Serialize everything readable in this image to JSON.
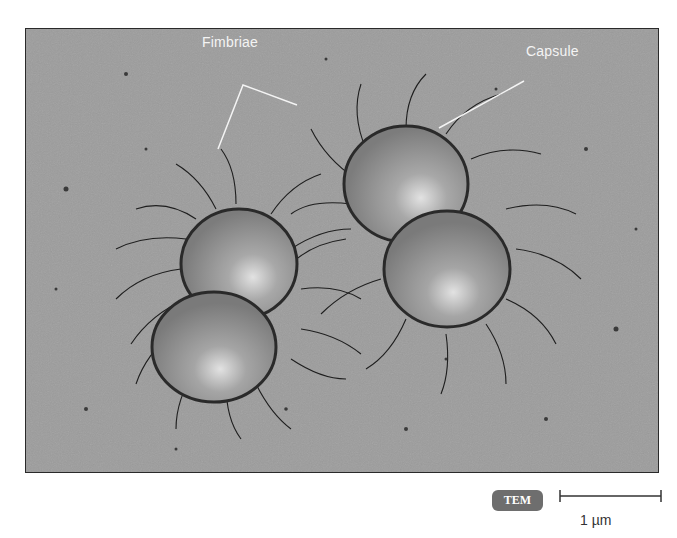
{
  "figure": {
    "type": "illustration",
    "labels": {
      "fimbriae": "Fimbriae",
      "capsule": "Capsule"
    },
    "microscopy_badge": "TEM",
    "scale_bar": {
      "label": "1 µm",
      "length_px": 101
    },
    "colors": {
      "background": "#9c9c9c",
      "cell": "#8a8a8a",
      "cell_highlight": "#d8d8d8",
      "fimbriae": "#1e1e1e",
      "label_text": "#f4f4f4",
      "badge": "#6e6e6e"
    }
  }
}
